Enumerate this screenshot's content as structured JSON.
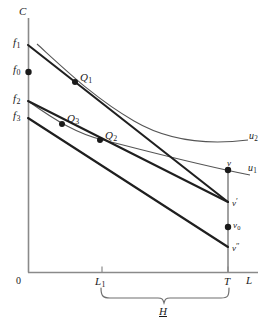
{
  "figure": {
    "type": "economics-indifference-curve-diagram",
    "width": 271,
    "height": 331,
    "background_color": "#ffffff",
    "ink_color": "#1a1a1a",
    "axis_color": "#7a7a7a"
  },
  "axes": {
    "y_axis_label": "C",
    "x_axis_label": "L",
    "origin_label": "0",
    "x_ticks": [
      {
        "label": "L",
        "sub": "1",
        "x": 102
      },
      {
        "label": "T",
        "sub": "",
        "x": 228
      }
    ]
  },
  "intercepts": [
    {
      "name": "f1",
      "label": "f",
      "sub": "1",
      "y": 45,
      "has_dot": false
    },
    {
      "name": "f0",
      "label": "f",
      "sub": "0",
      "y": 72,
      "has_dot": true
    },
    {
      "name": "f2",
      "label": "f",
      "sub": "2",
      "y": 101,
      "has_dot": false
    },
    {
      "name": "f3",
      "label": "f",
      "sub": "3",
      "y": 118,
      "has_dot": false
    }
  ],
  "equilibria": [
    {
      "name": "Q1",
      "label": "Q",
      "sub": "1",
      "x": 75,
      "y": 82
    },
    {
      "name": "Q3",
      "label": "Q",
      "sub": "3",
      "x": 62,
      "y": 124
    },
    {
      "name": "Q2",
      "label": "Q",
      "sub": "2",
      "x": 100,
      "y": 140
    }
  ],
  "indifference_curves": [
    {
      "name": "u2",
      "label": "u",
      "sub": "2"
    },
    {
      "name": "u1",
      "label": "u",
      "sub": "1"
    }
  ],
  "endowment_points": [
    {
      "name": "v",
      "label": "v",
      "prime": "",
      "sub": "",
      "x": 228,
      "y": 170,
      "has_dot": true
    },
    {
      "name": "v-prime",
      "label": "v",
      "prime": "′",
      "sub": "",
      "x": 228,
      "y": 202,
      "has_dot": false
    },
    {
      "name": "v0",
      "label": "v",
      "prime": "",
      "sub": "0",
      "x": 228,
      "y": 227,
      "has_dot": true
    },
    {
      "name": "v-double-prime",
      "label": "v",
      "prime": "″",
      "sub": "",
      "x": 228,
      "y": 247,
      "has_dot": false
    }
  ],
  "brace": {
    "label": "H",
    "from_tick": "L1",
    "to_tick": "T"
  }
}
